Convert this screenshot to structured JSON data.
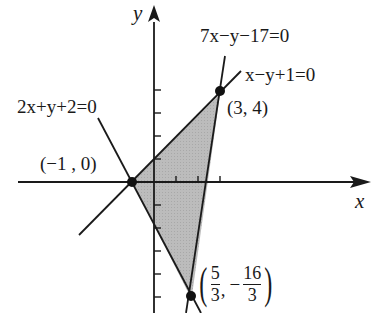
{
  "diagram": {
    "type": "linear-inequality-feasible-region",
    "axes": {
      "x_label": "x",
      "y_label": "y",
      "origin_px": [
        154,
        182
      ],
      "unit_px": 22
    },
    "lines": [
      {
        "id": "line1",
        "equation": "2x+y+2=0",
        "label": "2x+y+2=0"
      },
      {
        "id": "line2",
        "equation": "x-y+1=0",
        "label": "x−y+1=0"
      },
      {
        "id": "line3",
        "equation": "7x-y-17=0",
        "label": "7x−y−17=0"
      }
    ],
    "vertices": [
      {
        "label": "(−1 , 0)",
        "x": -1,
        "y": 0
      },
      {
        "label": "(3, 4)",
        "x": 3,
        "y": 4
      },
      {
        "label_num_x": "5",
        "label_den_x": "3",
        "label_sign": "−",
        "label_num_y": "16",
        "label_den_y": "3",
        "x": 1.6667,
        "y": -5.3333
      }
    ],
    "region_fill": "#bdbdbd",
    "line_color": "#1a1a1a"
  },
  "labels": {
    "y_axis": "y",
    "x_axis": "x",
    "eq_top": "7x−y−17=0",
    "eq_right": "x−y+1=0",
    "eq_left": "2x+y+2=0",
    "pt_34": "(3, 4)",
    "pt_m10": "(−1 , 0)",
    "pt3_num_x": "5",
    "pt3_den_x": "3",
    "pt3_comma": ",",
    "pt3_sign": "−",
    "pt3_num_y": "16",
    "pt3_den_y": "3"
  }
}
